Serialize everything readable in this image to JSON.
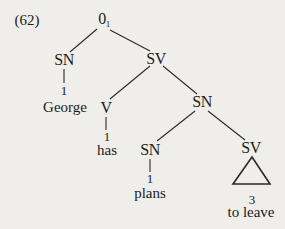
{
  "example_number": "(62)",
  "tree": {
    "root": {
      "label": "0",
      "subscript": "1"
    },
    "nodes": {
      "sn_subject": {
        "label": "SN",
        "index": "1",
        "word": "George"
      },
      "sv_main": {
        "label": "SV"
      },
      "v": {
        "label": "V",
        "index": "1",
        "word": "has"
      },
      "sn_object": {
        "label": "SN"
      },
      "sn_inner": {
        "label": "SN",
        "index": "1",
        "word": "plans"
      },
      "sv_inner": {
        "label": "SV",
        "index": "3",
        "word": "to leave",
        "abbreviated": true
      }
    }
  },
  "colors": {
    "background": "#efeeeb",
    "ink": "#1c1c1c"
  }
}
